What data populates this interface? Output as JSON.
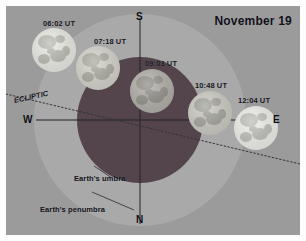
{
  "figure": {
    "title": "November 19",
    "background_color": "#9b9b9b",
    "frame_color": "#ffffff"
  },
  "shadows": {
    "penumbra": {
      "label": "Earth's penumbra",
      "color": "#a9a9a9",
      "cx": 134,
      "cy": 114,
      "r": 106
    },
    "umbra": {
      "label": "Earth's umbra",
      "color": "#53454b",
      "cx": 134,
      "cy": 114,
      "r": 63
    }
  },
  "cardinals": {
    "north": "N",
    "south": "S",
    "east": "E",
    "west": "W"
  },
  "ecliptic": {
    "label": "ECLIPTIC",
    "style": "dotted",
    "color": "#3a3a42"
  },
  "moons": [
    {
      "time_label": "06:02 UT",
      "cx": 48,
      "cy": 44,
      "r": 22,
      "fill": "#efefe9",
      "label_x": 37,
      "label_y": 14
    },
    {
      "time_label": "07:18 UT",
      "cx": 92,
      "cy": 62,
      "r": 22,
      "fill": "#d8d8cf",
      "label_x": 88,
      "label_y": 31
    },
    {
      "time_label": "09:03 UT",
      "cx": 146,
      "cy": 85,
      "r": 22,
      "fill": "#b5b2ac",
      "label_x": 139,
      "label_y": 53
    },
    {
      "time_label": "10:48 UT",
      "cx": 204,
      "cy": 107,
      "r": 22,
      "fill": "#cfcfc6",
      "label_x": 189,
      "label_y": 75
    },
    {
      "time_label": "12:04 UT",
      "cx": 250,
      "cy": 122,
      "r": 22,
      "fill": "#f3f3ee",
      "label_x": 232,
      "label_y": 90
    }
  ],
  "axes": {
    "meridian_color": "#2a2a30",
    "horizon_color": "#2a2a30"
  }
}
